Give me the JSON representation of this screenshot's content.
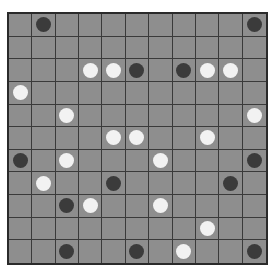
{
  "board": {
    "rows": 11,
    "cols": 11,
    "colors": {
      "cell": "#8e8e8e",
      "line": "#3a3a3a",
      "black": "#3b3b3b",
      "white": "#f2f2f2"
    },
    "stones": [
      {
        "row": 0,
        "col": 1,
        "color": "black"
      },
      {
        "row": 0,
        "col": 10,
        "color": "black"
      },
      {
        "row": 2,
        "col": 3,
        "color": "white"
      },
      {
        "row": 2,
        "col": 4,
        "color": "white"
      },
      {
        "row": 2,
        "col": 5,
        "color": "black"
      },
      {
        "row": 2,
        "col": 7,
        "color": "black"
      },
      {
        "row": 2,
        "col": 8,
        "color": "white"
      },
      {
        "row": 2,
        "col": 9,
        "color": "white"
      },
      {
        "row": 3,
        "col": 0,
        "color": "white"
      },
      {
        "row": 4,
        "col": 2,
        "color": "white"
      },
      {
        "row": 4,
        "col": 10,
        "color": "white"
      },
      {
        "row": 5,
        "col": 4,
        "color": "white"
      },
      {
        "row": 5,
        "col": 5,
        "color": "white"
      },
      {
        "row": 5,
        "col": 8,
        "color": "white"
      },
      {
        "row": 6,
        "col": 0,
        "color": "black"
      },
      {
        "row": 6,
        "col": 2,
        "color": "white"
      },
      {
        "row": 6,
        "col": 6,
        "color": "white"
      },
      {
        "row": 6,
        "col": 10,
        "color": "black"
      },
      {
        "row": 7,
        "col": 1,
        "color": "white"
      },
      {
        "row": 7,
        "col": 4,
        "color": "black"
      },
      {
        "row": 7,
        "col": 9,
        "color": "black"
      },
      {
        "row": 8,
        "col": 2,
        "color": "black"
      },
      {
        "row": 8,
        "col": 3,
        "color": "white"
      },
      {
        "row": 8,
        "col": 6,
        "color": "white"
      },
      {
        "row": 9,
        "col": 8,
        "color": "white"
      },
      {
        "row": 10,
        "col": 2,
        "color": "black"
      },
      {
        "row": 10,
        "col": 5,
        "color": "black"
      },
      {
        "row": 10,
        "col": 7,
        "color": "white"
      },
      {
        "row": 10,
        "col": 10,
        "color": "black"
      }
    ]
  }
}
